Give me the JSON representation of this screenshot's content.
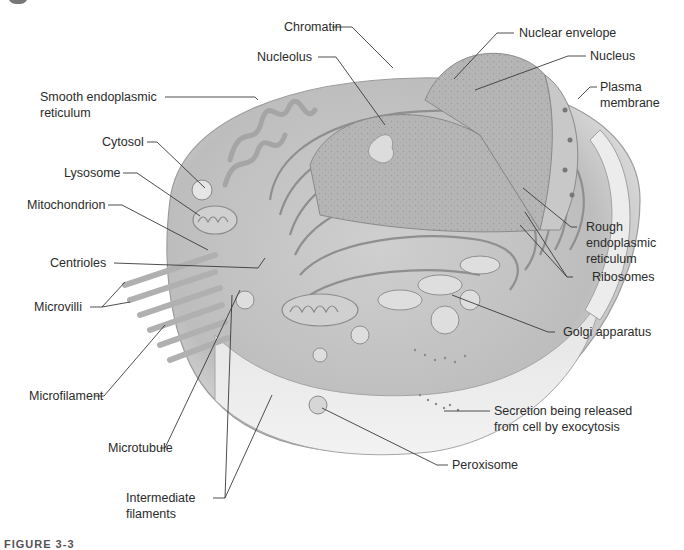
{
  "figure": {
    "caption_partial": "FIGURE 3-3"
  },
  "labels": {
    "chromatin": "Chromatin",
    "nucleolus": "Nucleolus",
    "nuclear_envelope": "Nuclear envelope",
    "nucleus": "Nucleus",
    "plasma_membrane_1": "Plasma",
    "plasma_membrane_2": "membrane",
    "smooth_er_1": "Smooth endoplasmic",
    "smooth_er_2": "reticulum",
    "cytosol": "Cytosol",
    "lysosome": "Lysosome",
    "mitochondrion": "Mitochondrion",
    "centrioles": "Centrioles",
    "microvilli": "Microvilli",
    "microfilament": "Microfilament",
    "microtubule": "Microtubule",
    "intermediate_1": "Intermediate",
    "intermediate_2": "filaments",
    "rough_er_1": "Rough",
    "rough_er_2": "endoplasmic",
    "rough_er_3": "reticulum",
    "ribosomes": "Ribosomes",
    "golgi": "Golgi apparatus",
    "secretion_1": "Secretion being released",
    "secretion_2": "from cell by exocytosis",
    "peroxisome": "Peroxisome"
  },
  "colors": {
    "line": "#3a3a3a",
    "cell_fill": "#d9d9d9",
    "cell_dark": "#a8a8a8",
    "nucleus_fill": "#b8b8b8"
  }
}
